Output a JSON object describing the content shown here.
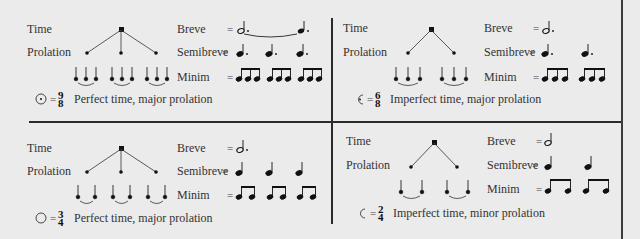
{
  "row_labels": {
    "time": "Time",
    "prolation": "Prolation",
    "breve": "Breve",
    "semibreve": "Semibreve",
    "minim": "Minim",
    "equals": "="
  },
  "panels": [
    {
      "id": "top-left",
      "sign": "⊙",
      "sign_name": "circle-with-dot",
      "numerator": "9",
      "denominator": "8",
      "caption": "Perfect time, major prolation",
      "time_branches": 3,
      "prolation_subdivisions": 3,
      "breve": "dotted half tied to dotted quarter",
      "semibreve_notes": 3,
      "semibreve_dotted": true,
      "minim_groups": 3,
      "minim_notes_per_group": 3
    },
    {
      "id": "top-right",
      "sign": "C·",
      "sign_name": "half-circle-with-dot",
      "numerator": "6",
      "denominator": "8",
      "caption": "Imperfect time, major prolation",
      "time_branches": 2,
      "prolation_subdivisions": 3,
      "breve": "dotted half",
      "semibreve_notes": 2,
      "semibreve_dotted": true,
      "minim_groups": 2,
      "minim_notes_per_group": 3
    },
    {
      "id": "bottom-left",
      "sign": "○",
      "sign_name": "circle",
      "numerator": "3",
      "denominator": "4",
      "caption": "Perfect time, major prolation",
      "time_branches": 3,
      "prolation_subdivisions": 2,
      "breve": "dotted half",
      "semibreve_notes": 3,
      "semibreve_dotted": false,
      "minim_groups": 3,
      "minim_notes_per_group": 2
    },
    {
      "id": "bottom-right",
      "sign": "C",
      "sign_name": "half-circle",
      "numerator": "2",
      "denominator": "4",
      "caption": "Imperfect time, minor prolation",
      "time_branches": 2,
      "prolation_subdivisions": 2,
      "breve": "half",
      "semibreve_notes": 2,
      "semibreve_dotted": false,
      "minim_groups": 2,
      "minim_notes_per_group": 2
    }
  ],
  "colors": {
    "background": "#ebebeb",
    "ink": "#222222",
    "rule": "#2a2a2a"
  }
}
